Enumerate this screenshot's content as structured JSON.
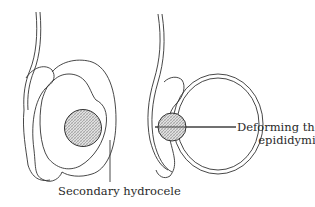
{
  "diagram": {
    "type": "anatomical line illustration",
    "figures": [
      {
        "id": "left",
        "description": "Testis with tumour surrounded by secondary hydrocele",
        "label": "Secondary hydrocele"
      },
      {
        "id": "right",
        "description": "Testis with tumour deforming the epididymis",
        "label_lines": [
          "Deforming the",
          "epididymis"
        ]
      }
    ],
    "colors": {
      "stroke": "#333333",
      "tumour_fill": "#c8c8c8",
      "background": "#ffffff"
    }
  }
}
